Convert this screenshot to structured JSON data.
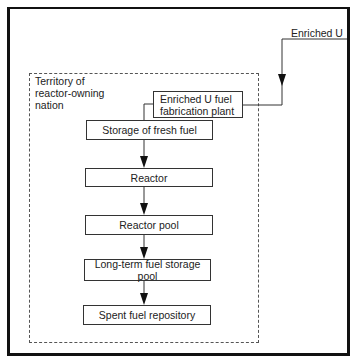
{
  "diagram": {
    "type": "flowchart",
    "source_input": {
      "label": "Enriched U"
    },
    "territory": {
      "label": "Territory of\nreactor-owning\nnation"
    },
    "nodes": [
      {
        "id": "fabrication",
        "label": "Enriched U fuel\nfabrication plant"
      },
      {
        "id": "fresh_storage",
        "label": "Storage of fresh fuel"
      },
      {
        "id": "reactor",
        "label": "Reactor"
      },
      {
        "id": "reactor_pool",
        "label": "Reactor pool"
      },
      {
        "id": "longterm_pool",
        "label": "Long-term fuel storage pool"
      },
      {
        "id": "repository",
        "label": "Spent fuel repository"
      }
    ],
    "edges": [
      {
        "from": "Enriched U",
        "to": "fabrication"
      },
      {
        "from": "fabrication",
        "to": "fresh_storage"
      },
      {
        "from": "fresh_storage",
        "to": "reactor"
      },
      {
        "from": "reactor",
        "to": "reactor_pool"
      },
      {
        "from": "reactor_pool",
        "to": "longterm_pool"
      },
      {
        "from": "longterm_pool",
        "to": "repository"
      }
    ]
  }
}
